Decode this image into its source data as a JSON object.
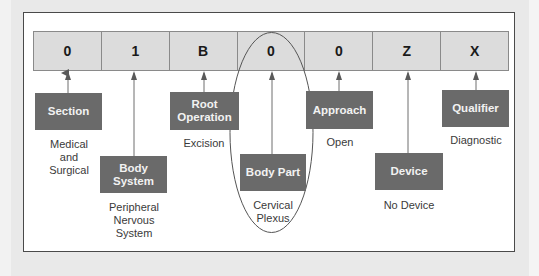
{
  "diagram": {
    "code": [
      {
        "char": "0",
        "position": 1
      },
      {
        "char": "1",
        "position": 2
      },
      {
        "char": "B",
        "position": 3
      },
      {
        "char": "0",
        "position": 4
      },
      {
        "char": "0",
        "position": 5
      },
      {
        "char": "Z",
        "position": 6
      },
      {
        "char": "X",
        "position": 7
      }
    ],
    "components": [
      {
        "label": "Section",
        "value": "Medical and Surgical",
        "value_lines": [
          "Medical",
          "and",
          "Surgical"
        ]
      },
      {
        "label": "Body System",
        "label_lines": [
          "Body",
          "System"
        ],
        "value": "Peripheral Nervous System",
        "value_lines": [
          "Peripheral",
          "Nervous",
          "System"
        ]
      },
      {
        "label": "Root Operation",
        "label_lines": [
          "Root",
          "Operation"
        ],
        "value": "Excision"
      },
      {
        "label": "Body Part",
        "value": "Cervical Plexus",
        "value_lines": [
          "Cervical",
          "Plexus"
        ],
        "highlighted": true
      },
      {
        "label": "Approach",
        "value": "Open"
      },
      {
        "label": "Device",
        "value": "No Device"
      },
      {
        "label": "Qualifier",
        "value": "Diagnostic"
      }
    ],
    "colors": {
      "label_box": "#6a6a6a",
      "label_text": "#f2f2f2",
      "code_cell": "#dcdcdc",
      "frame_border": "#4a4a4a",
      "background": "#e9e9e9"
    }
  }
}
